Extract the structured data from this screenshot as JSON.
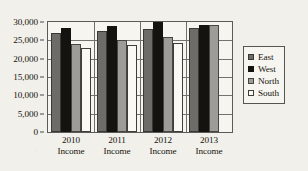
{
  "chart_data": {
    "type": "bar",
    "title": "",
    "subtitle": "",
    "xlabel": "",
    "ylabel": "",
    "categories": [
      "2010 Income",
      "2011 Income",
      "2012 Income",
      "2013 Income"
    ],
    "category_lines": [
      [
        "2010",
        "Income"
      ],
      [
        "2011",
        "Income"
      ],
      [
        "2012",
        "Income"
      ],
      [
        "2013",
        "Income"
      ]
    ],
    "series": [
      {
        "name": "East",
        "color": "#6d6c69",
        "values": [
          27000,
          27600,
          28000,
          28500
        ]
      },
      {
        "name": "West",
        "color": "#14130f",
        "values": [
          28500,
          29000,
          30000,
          29100
        ]
      },
      {
        "name": "North",
        "color": "#9d9c98",
        "values": [
          24000,
          25000,
          26000,
          29100
        ]
      },
      {
        "name": "South",
        "color": "#fbf9f4",
        "values": [
          23000,
          23800,
          24200,
          0
        ]
      }
    ],
    "ylim": [
      0,
      30000
    ],
    "ytick_values": [
      0,
      5000,
      10000,
      15000,
      20000,
      25000,
      30000
    ],
    "ytick_labels": [
      "0",
      "5,000",
      "10,000",
      "15,000",
      "20,000",
      "25,000",
      "30,000"
    ],
    "grid": true,
    "grid_axis": "y",
    "legend_position": "right",
    "legend_entries": [
      "East",
      "West",
      "North",
      "South"
    ]
  },
  "legend": {
    "items": [
      {
        "label": "East"
      },
      {
        "label": "West"
      },
      {
        "label": "North"
      },
      {
        "label": "South"
      }
    ]
  },
  "colors": {
    "east": "#6d6c69",
    "west": "#14130f",
    "north": "#9d9c98",
    "south": "#fbf9f4",
    "axis": "#15140f",
    "grid": "#73726f",
    "background": "#f2f0ea"
  }
}
